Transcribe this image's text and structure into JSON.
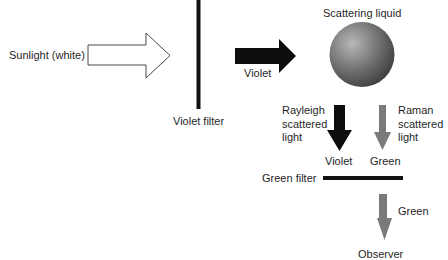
{
  "diagram": {
    "title": "",
    "labels": {
      "sunlight": "Sunlight (white)",
      "violet_filter": "Violet filter",
      "violet_beam": "Violet",
      "scattering_liquid": "Scattering liquid",
      "rayleigh": [
        "Rayleigh",
        "scattered",
        "light"
      ],
      "raman": [
        "Raman",
        "scattered",
        "light"
      ],
      "rayleigh_color": "Violet",
      "raman_color": "Green",
      "green_filter": "Green filter",
      "output_color": "Green",
      "observer": "Observer"
    },
    "colors": {
      "white_arrow_fill": "#ffffff",
      "outline": "#333333",
      "filter": "#111111",
      "violet_arrow": "#0d0d0d",
      "green_arrow": "#7a7a7a",
      "sphere_highlight": "#b5b5b5",
      "sphere_shadow": "#3a3a3a"
    },
    "nodes": [
      {
        "id": "sunlight",
        "type": "hollow-arrow",
        "direction": "right"
      },
      {
        "id": "violet-filter",
        "type": "vertical-bar"
      },
      {
        "id": "violet-beam",
        "type": "solid-arrow",
        "direction": "right"
      },
      {
        "id": "scattering-liquid",
        "type": "sphere"
      },
      {
        "id": "rayleigh-scattered",
        "type": "solid-arrow",
        "direction": "down"
      },
      {
        "id": "raman-scattered",
        "type": "gray-arrow",
        "direction": "down"
      },
      {
        "id": "green-filter",
        "type": "horizontal-bar"
      },
      {
        "id": "green-output",
        "type": "gray-arrow",
        "direction": "down"
      },
      {
        "id": "observer",
        "type": "label"
      }
    ],
    "edges": [
      {
        "from": "sunlight",
        "to": "violet-filter"
      },
      {
        "from": "violet-filter",
        "to": "scattering-liquid",
        "label": "Violet"
      },
      {
        "from": "scattering-liquid",
        "to": "green-filter",
        "label": "Violet (Rayleigh)"
      },
      {
        "from": "scattering-liquid",
        "to": "green-filter",
        "label": "Green (Raman)"
      },
      {
        "from": "green-filter",
        "to": "observer",
        "label": "Green"
      }
    ]
  }
}
